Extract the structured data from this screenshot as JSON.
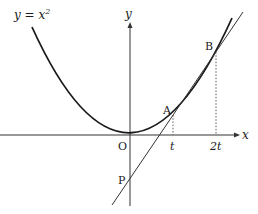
{
  "figure": {
    "curve_label": "y = x",
    "curve_label_exponent": "2",
    "axes": {
      "x_label": "x",
      "y_label": "y",
      "origin_label": "O"
    },
    "points": {
      "A": "A",
      "B": "B",
      "P": "P"
    },
    "ticks": {
      "t": "t",
      "two_t": "2t"
    },
    "colors": {
      "curve": "#1a1a1a",
      "line": "#333333",
      "axis": "#333333",
      "guide": "#555555"
    }
  }
}
